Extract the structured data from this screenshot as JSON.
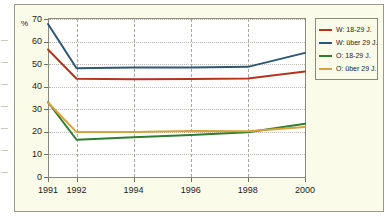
{
  "chart_data": {
    "type": "line",
    "title": "",
    "subtitle": "",
    "xlabel": "",
    "ylabel": "%",
    "unit_label": "%",
    "x": [
      1991,
      1992,
      1994,
      1996,
      1998,
      2000
    ],
    "xtick_labels": [
      "1991",
      "1992",
      "1994",
      "1996",
      "1998",
      "2000"
    ],
    "ytick_labels": [
      "0",
      "10",
      "20",
      "30",
      "40",
      "50",
      "60",
      "70"
    ],
    "yticks": [
      0,
      10,
      20,
      30,
      40,
      50,
      60,
      70
    ],
    "ylim": [
      0,
      70
    ],
    "xlim": [
      1991,
      2000
    ],
    "grid": true,
    "grid_style": "dotted horizontal, dashed vertical",
    "legend_position": "right",
    "series": [
      {
        "name": "W: 18-29 J.",
        "color": "#b5341f",
        "values": [
          56.5,
          43.5,
          43.3,
          43.4,
          43.6,
          46.7
        ]
      },
      {
        "name": "W: über 29 J.",
        "color": "#2e5773",
        "values": [
          67.8,
          48.2,
          48.5,
          48.5,
          48.8,
          55.0
        ]
      },
      {
        "name": "O: 18-29 J.",
        "color": "#2f7d31",
        "values": [
          33.2,
          16.5,
          17.6,
          18.6,
          19.8,
          23.6
        ]
      },
      {
        "name": "O: über 29 J.",
        "color": "#d9a23c",
        "values": [
          33.0,
          19.9,
          19.9,
          20.4,
          20.3,
          22.2
        ]
      }
    ]
  },
  "legend": {
    "items": [
      {
        "label": "W: 18-29 J.",
        "color": "#b5341f"
      },
      {
        "label": "W: über 29 J.",
        "color": "#2e5773"
      },
      {
        "label": "O: 18-29 J.",
        "color": "#2f7d31"
      },
      {
        "label": "O: über 29 J.",
        "color": "#d9a23c"
      }
    ]
  },
  "axes": {
    "y_unit": "%",
    "y_labels": [
      "70",
      "60",
      "50",
      "40",
      "30",
      "20",
      "10",
      "0"
    ],
    "x_labels": [
      "1991",
      "1992",
      "1994",
      "1996",
      "1998",
      "2000"
    ]
  },
  "colors": {
    "panel_background": "#fbfbe9",
    "plot_background": "#ffffff",
    "frame": "#9a9a8c",
    "text": "#1b1b1b",
    "gridline_h": "#b9b9b2",
    "gridline_v": "#a8a8a0"
  }
}
